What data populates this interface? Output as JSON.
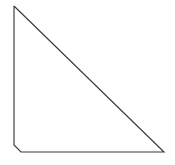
{
  "canvas": {
    "width": 175,
    "height": 165,
    "background_color": "#ffffff",
    "title": "Right Triangle Outline"
  },
  "figure": {
    "name": "right-triangle",
    "type": "polygon",
    "filled": false,
    "fill_color": "none",
    "stroke_color": "#3a3a3a",
    "stroke_width": 1.15,
    "vertices": [
      {
        "name": "apex-top-left",
        "x": 14,
        "y": 6
      },
      {
        "name": "chamfer-start-left",
        "x": 14,
        "y": 145
      },
      {
        "name": "chamfer-end-bottom",
        "x": 21,
        "y": 152
      },
      {
        "name": "corner-bottom-right",
        "x": 164,
        "y": 152
      }
    ],
    "points_attr": "14,6 14,145 21,152 164,152 14,6",
    "edges": [
      {
        "name": "left-leg",
        "orientation": "vertical",
        "length_px": 139
      },
      {
        "name": "bottom-left-chamfer",
        "orientation": "diagonal",
        "length_px": 10
      },
      {
        "name": "bottom-leg",
        "orientation": "horizontal",
        "length_px": 143
      },
      {
        "name": "hypotenuse",
        "orientation": "diagonal",
        "length_px": 204
      }
    ]
  }
}
